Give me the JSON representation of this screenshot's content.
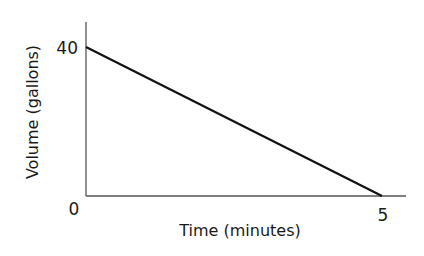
{
  "chart_data": {
    "type": "line",
    "title": "",
    "xlabel": "Time (minutes)",
    "ylabel": "Volume (gallons)",
    "x": [
      0,
      5
    ],
    "series": [
      {
        "name": "Volume",
        "values": [
          40,
          0
        ]
      }
    ],
    "x_ticks": [
      "5"
    ],
    "y_ticks": [
      "40"
    ],
    "origin_label": "0",
    "xlim": [
      0,
      5.5
    ],
    "ylim": [
      0,
      50
    ],
    "grid": false,
    "legend": null
  },
  "axes": {
    "xlabel": "Time (minutes)",
    "ylabel": "Volume (gallons)",
    "origin_label": "0",
    "x_tick_label": "5",
    "y_tick_label": "40"
  },
  "colors": {
    "axis": "#555555",
    "line": "#111111",
    "text": "#1a1a1a"
  }
}
